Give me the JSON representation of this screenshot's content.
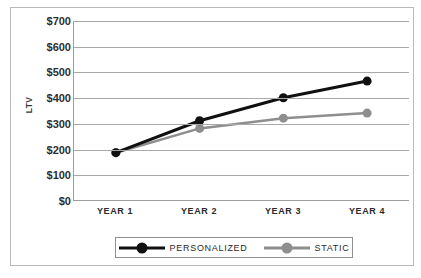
{
  "figure": {
    "caption": ""
  },
  "axes": {
    "y_title": "LTV",
    "y_ticks": [
      "$700",
      "$600",
      "$500",
      "$400",
      "$300",
      "$200",
      "$100",
      "$0"
    ],
    "x_ticks": [
      "YEAR 1",
      "YEAR 2",
      "YEAR 3",
      "YEAR 4"
    ]
  },
  "legend": {
    "entries": [
      {
        "label": "PERSONALIZED",
        "color": "#101010"
      },
      {
        "label": "STATIC",
        "color": "#8e8e8e"
      }
    ]
  },
  "chart_data": {
    "type": "line",
    "title": "",
    "xlabel": "",
    "ylabel": "LTV",
    "categories": [
      "YEAR 1",
      "YEAR 2",
      "YEAR 3",
      "YEAR 4"
    ],
    "ylim": [
      0,
      700
    ],
    "ytick_step": 100,
    "ytick_values": [
      0,
      100,
      200,
      300,
      400,
      500,
      600,
      700
    ],
    "ytick_labels": [
      "$0",
      "$100",
      "$200",
      "$300",
      "$400",
      "$500",
      "$600",
      "$700"
    ],
    "grid": "horizontal",
    "legend_position": "bottom",
    "series": [
      {
        "name": "PERSONALIZED",
        "color": "#101010",
        "line_width": 3,
        "marker": "circle",
        "marker_size": 9,
        "values": [
          185,
          310,
          400,
          465
        ]
      },
      {
        "name": "STATIC",
        "color": "#8e8e8e",
        "line_width": 2.5,
        "marker": "circle",
        "marker_size": 9,
        "values": [
          185,
          280,
          320,
          340
        ]
      }
    ]
  }
}
